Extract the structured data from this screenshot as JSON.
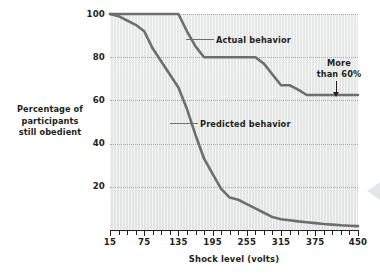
{
  "chart_data": {
    "type": "line",
    "title": "",
    "xlabel": "Shock level (volts)",
    "ylabel": "Percentage of participants\nstill obedient",
    "xlim": [
      15,
      450
    ],
    "ylim": [
      0,
      100
    ],
    "grid": true,
    "legend_position": "inline-annotations",
    "x_ticks": [
      15,
      75,
      135,
      195,
      255,
      315,
      375,
      450
    ],
    "x_tick_labels": [
      "15",
      "75",
      "135",
      "195",
      "255",
      "315",
      "375",
      "450"
    ],
    "x_minor_tick_step": 15,
    "y_ticks": [
      20,
      40,
      60,
      80,
      100
    ],
    "y_tick_labels": [
      "20",
      "40",
      "60",
      "80",
      "100"
    ],
    "series": [
      {
        "name": "Actual behavior",
        "color": "#6d6e70",
        "x": [
          15,
          30,
          45,
          60,
          75,
          90,
          105,
          120,
          135,
          150,
          165,
          180,
          195,
          210,
          225,
          240,
          255,
          270,
          285,
          300,
          315,
          330,
          345,
          360,
          375,
          390,
          405,
          420,
          435,
          450
        ],
        "values": [
          100,
          100,
          100,
          100,
          100,
          100,
          100,
          100,
          100,
          92,
          85,
          80,
          80,
          80,
          80,
          80,
          80,
          80,
          77,
          72,
          67,
          67,
          65,
          62.5,
          62.5,
          62.5,
          62.5,
          62.5,
          62.5,
          62.5
        ]
      },
      {
        "name": "Predicted behavior",
        "color": "#6d6e70",
        "x": [
          15,
          30,
          45,
          60,
          75,
          90,
          105,
          120,
          135,
          150,
          165,
          180,
          195,
          210,
          225,
          240,
          255,
          270,
          285,
          300,
          315,
          330,
          345,
          360,
          375,
          390,
          405,
          420,
          435,
          450
        ],
        "values": [
          100,
          99,
          97,
          95,
          92,
          84,
          78,
          72,
          66,
          56,
          44,
          33,
          26,
          19,
          15,
          14,
          12,
          10,
          8,
          6,
          5,
          4.5,
          4,
          3.6,
          3.2,
          2.8,
          2.5,
          2.2,
          2,
          1.8
        ]
      }
    ],
    "annotations": [
      {
        "id": "actual",
        "text": "Actual behavior",
        "points_to_series": "Actual behavior"
      },
      {
        "id": "predicted",
        "text": "Predicted behavior",
        "points_to_series": "Predicted behavior"
      },
      {
        "id": "more",
        "text": "More\nthan 60%",
        "points_to_value": 62.5
      }
    ]
  },
  "axes": {
    "y_title": "Percentage of\nparticipants\nstill obedient",
    "x_title": "Shock level (volts)"
  },
  "annotations": {
    "actual_label": "Actual behavior",
    "predicted_label": "Predicted behavior",
    "more_than_label": "More\nthan 60%"
  },
  "colors": {
    "line": "#6d6e70",
    "text": "#231f20",
    "plot_background": "#eceded",
    "gridline": "#a9abab"
  }
}
